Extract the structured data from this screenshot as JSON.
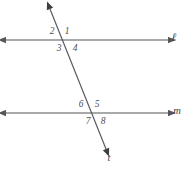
{
  "figure": {
    "type": "geometry-diagram",
    "width": 192,
    "height": 170,
    "background_color": "#ffffff",
    "stroke_color": "#55555a",
    "label_color": "#4e4e53",
    "lines": [
      {
        "id": "line-l",
        "label": "ℓ",
        "kind": "horizontal-parallel-line",
        "label_x": 174,
        "label_y": 38,
        "x1": 6,
        "y1": 40,
        "x2": 168,
        "y2": 40,
        "arrow_start": true,
        "arrow_end": true
      },
      {
        "id": "line-m",
        "label": "m",
        "kind": "horizontal-parallel-line",
        "label_x": 177,
        "label_y": 111,
        "x1": 6,
        "y1": 113,
        "x2": 168,
        "y2": 113,
        "arrow_start": true,
        "arrow_end": true
      },
      {
        "id": "line-t",
        "label": "t",
        "kind": "transversal",
        "label_x": 109,
        "label_y": 158,
        "x1": 50,
        "y1": 9,
        "x2": 106,
        "y2": 149,
        "arrow_start": true,
        "arrow_end": true
      }
    ],
    "intersections": [
      {
        "id": "intersection-l-t",
        "x": 63,
        "y": 40
      },
      {
        "id": "intersection-m-t",
        "x": 92,
        "y": 113
      }
    ],
    "angles": [
      {
        "id": "angle-1",
        "label": "1",
        "x": 67,
        "y": 32,
        "at": "intersection-l-t",
        "position": "upper-right"
      },
      {
        "id": "angle-2",
        "label": "2",
        "x": 52,
        "y": 32,
        "at": "intersection-l-t",
        "position": "upper-left"
      },
      {
        "id": "angle-3",
        "label": "3",
        "x": 59,
        "y": 49,
        "at": "intersection-l-t",
        "position": "lower-left"
      },
      {
        "id": "angle-4",
        "label": "4",
        "x": 75,
        "y": 49,
        "at": "intersection-l-t",
        "position": "lower-right"
      },
      {
        "id": "angle-5",
        "label": "5",
        "x": 97,
        "y": 105,
        "at": "intersection-m-t",
        "position": "upper-right"
      },
      {
        "id": "angle-6",
        "label": "6",
        "x": 81,
        "y": 105,
        "at": "intersection-m-t",
        "position": "upper-left"
      },
      {
        "id": "angle-7",
        "label": "7",
        "x": 88,
        "y": 122,
        "at": "intersection-m-t",
        "position": "lower-left"
      },
      {
        "id": "angle-8",
        "label": "8",
        "x": 103,
        "y": 122,
        "at": "intersection-m-t",
        "position": "lower-right"
      }
    ]
  }
}
